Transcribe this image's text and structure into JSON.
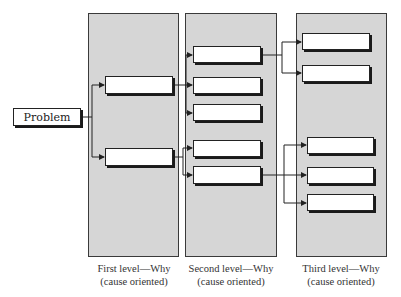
{
  "diagram": {
    "type": "why-why tree",
    "root": {
      "label": "Problem"
    },
    "levels": [
      {
        "title_line1": "First level—Why",
        "title_line2": "(cause oriented)",
        "box_count": 2
      },
      {
        "title_line1": "Second level—Why",
        "title_line2": "(cause oriented)",
        "box_count": 5
      },
      {
        "title_line1": "Third level—Why",
        "title_line2": "(cause oriented)",
        "box_count": 5
      }
    ],
    "colors": {
      "panel": "#d6d6d6",
      "border": "#3a3a3a",
      "box": "#ffffff",
      "line": "#222222"
    }
  }
}
